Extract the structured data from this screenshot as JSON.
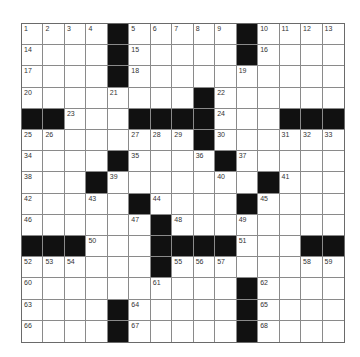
{
  "puzzle": {
    "rows": 15,
    "cols": 15,
    "grid": [
      "....#.....#....",
      "....#.....#....",
      "....#..........",
      "........#......",
      "##...####...###",
      "........#......",
      "....#....#.....",
      "...#.......#...",
      ".....#....#....",
      "......#........",
      "###...####...##",
      "......#........",
      "..........#....",
      "....#.....#....",
      "....#.....#...."
    ],
    "numbers": [
      [
        1,
        2,
        3,
        4,
        0,
        5,
        6,
        7,
        8,
        9,
        0,
        10,
        11,
        12,
        13
      ],
      [
        14,
        0,
        0,
        0,
        0,
        15,
        0,
        0,
        0,
        0,
        0,
        16,
        0,
        0,
        0
      ],
      [
        17,
        0,
        0,
        0,
        0,
        18,
        0,
        0,
        0,
        0,
        19,
        0,
        0,
        0,
        0
      ],
      [
        20,
        0,
        0,
        0,
        21,
        0,
        0,
        0,
        0,
        22,
        0,
        0,
        0,
        0,
        0
      ],
      [
        0,
        0,
        23,
        0,
        0,
        0,
        0,
        0,
        0,
        24,
        0,
        0,
        0,
        0,
        0
      ],
      [
        25,
        26,
        0,
        0,
        0,
        27,
        28,
        29,
        0,
        30,
        0,
        0,
        31,
        32,
        33
      ],
      [
        34,
        0,
        0,
        0,
        0,
        35,
        0,
        0,
        36,
        0,
        37,
        0,
        0,
        0,
        0
      ],
      [
        38,
        0,
        0,
        0,
        39,
        0,
        0,
        0,
        0,
        40,
        0,
        0,
        41,
        0,
        0
      ],
      [
        42,
        0,
        0,
        43,
        0,
        0,
        44,
        0,
        0,
        0,
        0,
        45,
        0,
        0,
        0
      ],
      [
        46,
        0,
        0,
        0,
        0,
        47,
        0,
        48,
        0,
        0,
        49,
        0,
        0,
        0,
        0
      ],
      [
        0,
        0,
        0,
        50,
        0,
        0,
        0,
        0,
        0,
        0,
        51,
        0,
        0,
        0,
        0
      ],
      [
        52,
        53,
        54,
        0,
        0,
        0,
        0,
        55,
        56,
        57,
        0,
        0,
        0,
        58,
        59
      ],
      [
        60,
        0,
        0,
        0,
        0,
        0,
        61,
        0,
        0,
        0,
        0,
        62,
        0,
        0,
        0
      ],
      [
        63,
        0,
        0,
        0,
        0,
        64,
        0,
        0,
        0,
        0,
        0,
        65,
        0,
        0,
        0
      ],
      [
        66,
        0,
        0,
        0,
        0,
        67,
        0,
        0,
        0,
        0,
        0,
        68,
        0,
        0,
        0
      ]
    ]
  },
  "colors": {
    "black_square": "#111111",
    "white_square": "#ffffff",
    "grid_line": "#8a8a8a",
    "number_text": "#333333"
  }
}
